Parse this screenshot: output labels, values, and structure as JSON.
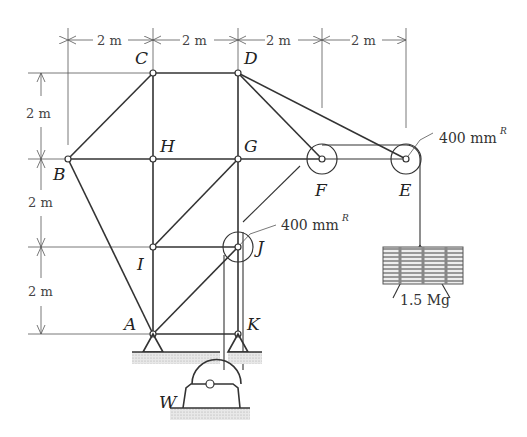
{
  "figure": {
    "dimensions": {
      "horizontal": [
        "2 m",
        "2 m",
        "2 m",
        "2 m"
      ],
      "vertical": [
        "2 m",
        "2 m",
        "2 m"
      ]
    },
    "joints": {
      "A": "A",
      "B": "B",
      "C": "C",
      "D": "D",
      "E": "E",
      "F": "F",
      "G": "G",
      "H": "H",
      "I": "I",
      "J": "J",
      "K": "K"
    },
    "winch_label": "W",
    "pulley_E_radius": "400 mm",
    "pulley_J_radius": "400 mm",
    "radius_superscript": "R",
    "load_label": "1.5 Mg"
  }
}
